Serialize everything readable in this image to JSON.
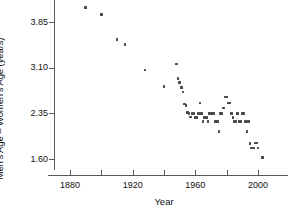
{
  "chart_data": {
    "type": "scatter",
    "title": "",
    "xlabel": "Year",
    "ylabel": "Men's Age – Women's Age (years)",
    "xlim": [
      1868,
      2012
    ],
    "ylim": [
      1.45,
      4.25
    ],
    "grid": false,
    "legend": null,
    "xticks": [
      1880,
      1920,
      1960,
      2000
    ],
    "xticks_minor": [
      1900,
      1940,
      1980
    ],
    "xtick_labels": [
      "1880",
      "1920",
      "1960",
      "2000"
    ],
    "yticks": [
      1.6,
      2.35,
      3.1,
      3.85
    ],
    "ytick_labels": [
      "1.60",
      "2.35",
      "3.10",
      "3.85"
    ],
    "marker": "square",
    "marker_color": "#4a4a4a",
    "points": [
      [
        1890,
        4.09
      ],
      [
        1900,
        3.97
      ],
      [
        1910,
        3.56
      ],
      [
        1915,
        3.48
      ],
      [
        1928,
        3.06
      ],
      [
        1940,
        2.79
      ],
      [
        1948,
        3.16
      ],
      [
        1949,
        2.92
      ],
      [
        1950,
        2.86
      ],
      [
        1951,
        2.77
      ],
      [
        1952,
        2.7
      ],
      [
        1953,
        2.5
      ],
      [
        1954,
        2.48
      ],
      [
        1955,
        2.36
      ],
      [
        1956,
        2.35
      ],
      [
        1957,
        2.29
      ],
      [
        1958,
        2.35
      ],
      [
        1959,
        2.35
      ],
      [
        1960,
        2.28
      ],
      [
        1961,
        2.28
      ],
      [
        1962,
        2.35
      ],
      [
        1963,
        2.52
      ],
      [
        1964,
        2.35
      ],
      [
        1965,
        2.22
      ],
      [
        1966,
        2.28
      ],
      [
        1967,
        2.28
      ],
      [
        1968,
        2.22
      ],
      [
        1969,
        2.35
      ],
      [
        1970,
        2.35
      ],
      [
        1971,
        2.35
      ],
      [
        1972,
        2.35
      ],
      [
        1973,
        2.22
      ],
      [
        1974,
        2.22
      ],
      [
        1975,
        2.05
      ],
      [
        1976,
        2.35
      ],
      [
        1977,
        2.35
      ],
      [
        1978,
        2.44
      ],
      [
        1979,
        2.62
      ],
      [
        1980,
        2.62
      ],
      [
        1981,
        2.52
      ],
      [
        1982,
        2.52
      ],
      [
        1983,
        2.35
      ],
      [
        1984,
        2.28
      ],
      [
        1985,
        2.22
      ],
      [
        1986,
        2.22
      ],
      [
        1987,
        2.35
      ],
      [
        1988,
        2.22
      ],
      [
        1989,
        2.22
      ],
      [
        1990,
        2.35
      ],
      [
        1991,
        2.35
      ],
      [
        1992,
        2.22
      ],
      [
        1993,
        2.05
      ],
      [
        1994,
        2.22
      ],
      [
        1995,
        1.85
      ],
      [
        1996,
        1.78
      ],
      [
        1997,
        1.78
      ],
      [
        1998,
        1.86
      ],
      [
        1999,
        1.86
      ],
      [
        2000,
        1.78
      ],
      [
        2003,
        1.62
      ]
    ]
  },
  "axes": {
    "ylabel": "Men's Age – Women's Age (years)",
    "xlabel": "Year"
  }
}
